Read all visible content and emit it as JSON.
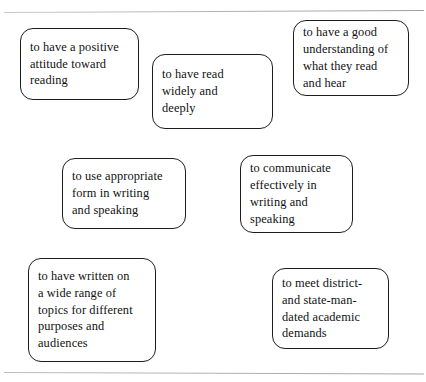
{
  "page": {
    "background_color": "#ffffff",
    "rule_color": "#b9b9b9",
    "box_border_color": "#1d1d1d",
    "text_color": "#111111"
  },
  "diagram": {
    "type": "concept-cluster",
    "node_count": 7,
    "nodes": [
      {
        "id": "positive-attitude",
        "text": "to have a positive\nattitude toward\nreading"
      },
      {
        "id": "read-widely",
        "text": "to have read\nwidely and\ndeeply"
      },
      {
        "id": "good-understanding",
        "text": "to have a good\nunderstanding of\nwhat they read\nand hear"
      },
      {
        "id": "appropriate-form",
        "text": "to use appropriate\nform in writing\nand speaking"
      },
      {
        "id": "communicate-effectively",
        "text": "to communicate\neffectively in\nwriting and\nspeaking"
      },
      {
        "id": "written-wide-range",
        "text": "to have written on\na wide range of\ntopics for different\npurposes and\naudiences"
      },
      {
        "id": "mandated-demands",
        "text": "to meet district-\nand state-man-\ndated academic\ndemands"
      }
    ]
  }
}
